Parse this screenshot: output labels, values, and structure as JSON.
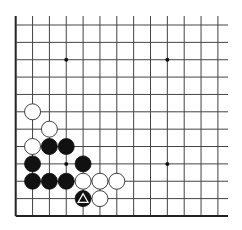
{
  "board": {
    "columns": 13,
    "rows": 12,
    "origin_x": 15.7,
    "origin_y": 25,
    "spacing_x": 16.85,
    "spacing_y": 17.36,
    "line_top": 16,
    "line_right_extend": 228,
    "edges": {
      "left": true,
      "bottom": true,
      "top": false,
      "right": false
    },
    "line_color": "#444444",
    "edge_color": "#222222",
    "background": "#ffffff"
  },
  "star_points": [
    {
      "col": 3,
      "row": 2
    },
    {
      "col": 9,
      "row": 2
    },
    {
      "col": 3,
      "row": 8
    },
    {
      "col": 9,
      "row": 8
    }
  ],
  "stones": [
    {
      "color": "white",
      "col": 1,
      "row": 5
    },
    {
      "color": "white",
      "col": 2,
      "row": 6
    },
    {
      "color": "white",
      "col": 1,
      "row": 7
    },
    {
      "color": "black",
      "col": 2,
      "row": 7
    },
    {
      "color": "black",
      "col": 3,
      "row": 7
    },
    {
      "color": "black",
      "col": 1,
      "row": 8
    },
    {
      "color": "black",
      "col": 4,
      "row": 8
    },
    {
      "color": "black",
      "col": 1,
      "row": 9
    },
    {
      "color": "black",
      "col": 2,
      "row": 9
    },
    {
      "color": "black",
      "col": 3,
      "row": 9
    },
    {
      "color": "white",
      "col": 4,
      "row": 9
    },
    {
      "color": "white",
      "col": 5,
      "row": 9
    },
    {
      "color": "white",
      "col": 6,
      "row": 9
    },
    {
      "color": "black",
      "col": 4,
      "row": 10,
      "marker": "triangle"
    },
    {
      "color": "white",
      "col": 5,
      "row": 10
    }
  ]
}
